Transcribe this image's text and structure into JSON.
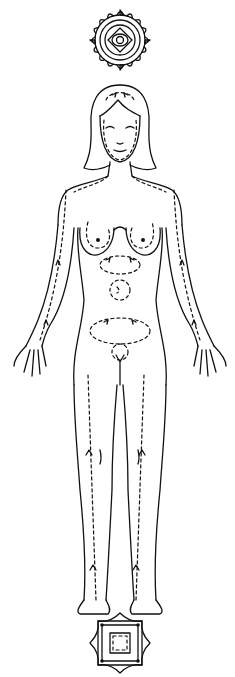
{
  "figure": {
    "colors": {
      "ink": "#111111",
      "background": "#ffffff"
    },
    "symbols": {
      "top": {
        "name": "crown-lotus-mandala",
        "shape": "circular petal wheel with concentric center"
      },
      "bottom": {
        "name": "root-square-mandala",
        "shape": "square with lotus points and inner square"
      }
    },
    "flow_markers": {
      "arms": "dashed lines with upward arrows",
      "legs": "dashed lines with upward arrows",
      "torso": [
        "heart loop",
        "solar plexus loop",
        "navel spiral",
        "lower abdomen loop",
        "pelvic loop"
      ],
      "head": "dashed loops around face and crown"
    }
  }
}
